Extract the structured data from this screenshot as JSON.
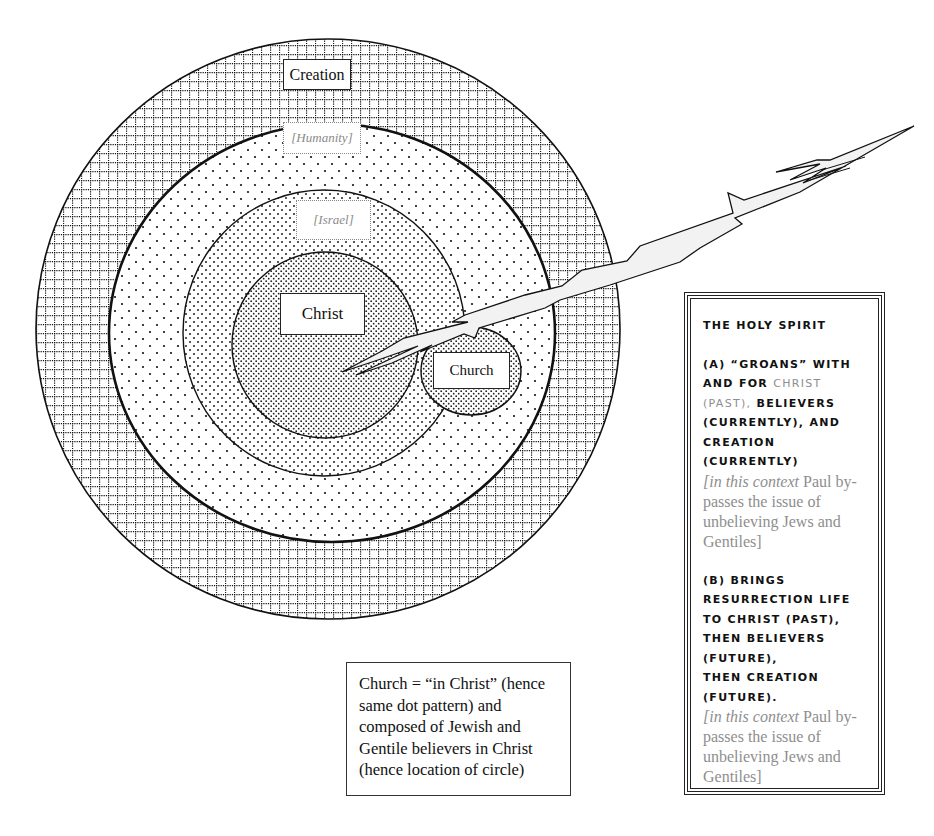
{
  "diagram": {
    "type": "concentric-circles",
    "circles": [
      {
        "id": "creation",
        "label": "Creation",
        "pattern": "dotted-grid",
        "label_style": "solid"
      },
      {
        "id": "humanity",
        "label": "[Humanity]",
        "pattern": "sparse-dots",
        "label_style": "dim-italic"
      },
      {
        "id": "israel",
        "label": "[Israel]",
        "pattern": "medium-dots",
        "label_style": "dim-italic"
      },
      {
        "id": "christ",
        "label": "Christ",
        "pattern": "dense-dots",
        "label_style": "solid"
      },
      {
        "id": "church",
        "label": "Church",
        "pattern": "dense-dots",
        "label_style": "solid"
      }
    ],
    "arrow": {
      "name": "holy-spirit-lightning-bolt",
      "from": "upper-right",
      "to": "christ-circle"
    }
  },
  "note": {
    "text": "Church = “in Christ” (hence same dot pattern) and composed of Jewish and Gentile believers in Christ (hence location of circle)",
    "lines": [
      "Church = “in Christ” (hence",
      "same dot pattern) and",
      "composed of Jewish and",
      "Gentile believers in Christ",
      "(hence location of circle)"
    ]
  },
  "holy_spirit": {
    "title": "The Holy Spirit",
    "section_a": {
      "lines": [
        "(A) “Groans” with",
        "and for"
      ],
      "christ": "Christ",
      "past": "(past),",
      "rest": [
        "believers",
        "(currently), and",
        "creation",
        "(currently)"
      ],
      "bracket_italic": "[in this context",
      "bracket_lines": [
        " Paul by-",
        "passes the issue of",
        "unbelieving Jews and",
        "Gentiles]"
      ]
    },
    "section_b": {
      "lines": [
        "(B) brings",
        "resurrection life",
        "to Christ (past),",
        "then believers",
        "(future),",
        "then creation",
        "(future)."
      ],
      "bracket_italic": "[in this context",
      "bracket_lines": [
        " Paul by-",
        "passes the issue of",
        "unbelieving Jews and",
        "Gentiles]"
      ]
    }
  }
}
